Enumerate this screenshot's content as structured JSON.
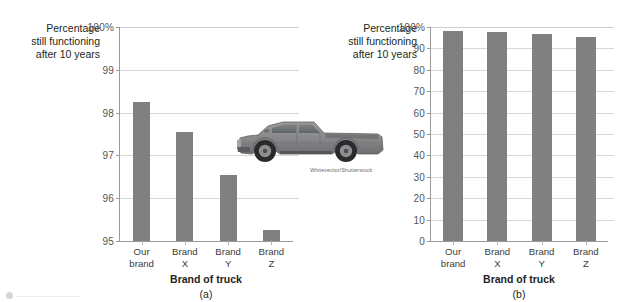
{
  "figure": {
    "photo_credit": "Whitevector/Shutterstock",
    "truck_alt": "grey pickup truck side view",
    "bar_color": "#808080",
    "grid_color": "#d7d7d7",
    "axis_color": "#9a9a9a"
  },
  "chart_data": [
    {
      "type": "bar",
      "panel": "(a)",
      "title": "",
      "categories": [
        "Our brand",
        "Brand X",
        "Brand Y",
        "Brand Z"
      ],
      "category_lines": [
        [
          "Our",
          "brand"
        ],
        [
          "Brand",
          "X"
        ],
        [
          "Brand",
          "Y"
        ],
        [
          "Brand",
          "Z"
        ]
      ],
      "values": [
        98.25,
        97.55,
        96.55,
        95.25
      ],
      "xlabel": "Brand of truck",
      "ylabel": "Percentage still functioning after 10 years",
      "ylabel_lines": [
        "Percentage",
        "still functioning",
        "after 10 years"
      ],
      "ylim": [
        95,
        100
      ],
      "yticks": [
        95,
        96,
        97,
        98,
        99,
        100
      ],
      "ytick_labels": [
        "95",
        "96",
        "97",
        "98",
        "99",
        "100%"
      ],
      "grid": true,
      "legend": "none"
    },
    {
      "type": "bar",
      "panel": "(b)",
      "title": "",
      "categories": [
        "Our brand",
        "Brand X",
        "Brand Y",
        "Brand Z"
      ],
      "category_lines": [
        [
          "Our",
          "brand"
        ],
        [
          "Brand",
          "X"
        ],
        [
          "Brand",
          "Y"
        ],
        [
          "Brand",
          "Z"
        ]
      ],
      "values": [
        98.25,
        97.55,
        96.55,
        95.25
      ],
      "xlabel": "Brand of truck",
      "ylabel": "Percentage still functioning after 10 years",
      "ylabel_lines": [
        "Percentage",
        "still functioning",
        "after 10 years"
      ],
      "ylim": [
        0,
        100
      ],
      "yticks": [
        0,
        10,
        20,
        30,
        40,
        50,
        60,
        70,
        80,
        90,
        100
      ],
      "ytick_labels": [
        "0",
        "10",
        "20",
        "30",
        "40",
        "50",
        "60",
        "70",
        "80",
        "90",
        "100%"
      ],
      "grid": true,
      "legend": "none"
    }
  ]
}
